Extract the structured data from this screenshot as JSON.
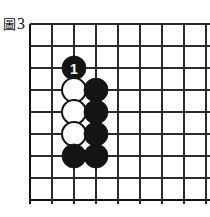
{
  "figure": {
    "caption_cjk": "圖",
    "caption_number": "3",
    "caption_full": "圖3"
  },
  "board": {
    "type": "go-board-diagram",
    "visible_columns": 9,
    "visible_rows": 9,
    "origin_x": 30,
    "origin_y": 24,
    "cell_size": 22,
    "bleed_right": 9,
    "bleed_bottom": 4,
    "line_color": "#2b2b2b",
    "edge_color": "#111111",
    "background_color": "#ffffff",
    "black_color": "#141414",
    "white_color": "#ffffff"
  },
  "stones": [
    {
      "name": "move-1-black",
      "color": "black",
      "col": 2,
      "row": 2,
      "label": "1"
    },
    {
      "name": "white-stone-a",
      "color": "white",
      "col": 2,
      "row": 3,
      "label": ""
    },
    {
      "name": "white-stone-b",
      "color": "white",
      "col": 2,
      "row": 4,
      "label": ""
    },
    {
      "name": "white-stone-c",
      "color": "white",
      "col": 2,
      "row": 5,
      "label": ""
    },
    {
      "name": "black-stone-a",
      "color": "black",
      "col": 3,
      "row": 3,
      "label": ""
    },
    {
      "name": "black-stone-b",
      "color": "black",
      "col": 3,
      "row": 4,
      "label": ""
    },
    {
      "name": "black-stone-c",
      "color": "black",
      "col": 3,
      "row": 5,
      "label": ""
    },
    {
      "name": "black-stone-d",
      "color": "black",
      "col": 3,
      "row": 6,
      "label": ""
    },
    {
      "name": "black-stone-e",
      "color": "black",
      "col": 2,
      "row": 6,
      "label": ""
    }
  ]
}
